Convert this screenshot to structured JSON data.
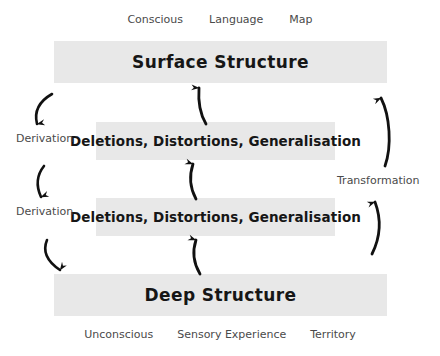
{
  "diagram": {
    "colors": {
      "band_fill": "#e8e8e8",
      "band_text": "#161616",
      "caption_text": "#4a4a4a",
      "arrow": "#111111",
      "background": "#ffffff"
    },
    "top_captions": [
      {
        "label": "Conscious"
      },
      {
        "label": "Language"
      },
      {
        "label": "Map"
      }
    ],
    "bottom_captions": [
      {
        "label": "Unconscious"
      },
      {
        "label": "Sensory Experience"
      },
      {
        "label": "Territory"
      }
    ],
    "bands": {
      "surface": {
        "label": "Surface Structure"
      },
      "filters_upper": {
        "label": "Deletions, Distortions, Generalisation"
      },
      "filters_lower": {
        "label": "Deletions, Distortions, Generalisation"
      },
      "deep": {
        "label": "Deep Structure"
      }
    },
    "process_labels": {
      "derivation_upper": "Derivation",
      "derivation_lower": "Derivation",
      "transformation": "Transformation"
    },
    "arrows": {
      "derivation_upper": "curved-arrow-down",
      "derivation_lower": "curved-arrow-down",
      "transformation_upper": "curved-arrow-up",
      "transformation_lower": "curved-arrow-up",
      "center_upper": "curved-arrow-up",
      "center_middle": "curved-arrow-up",
      "center_lower": "curved-arrow-up"
    }
  }
}
